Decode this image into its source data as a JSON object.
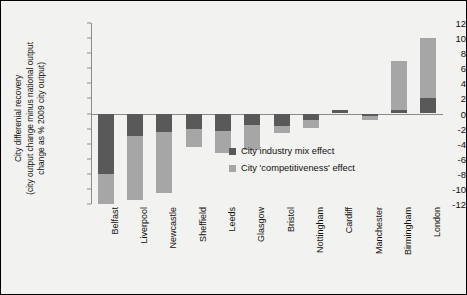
{
  "chart_data": {
    "type": "bar",
    "stacked": true,
    "title": "",
    "xlabel": "",
    "ylabel": "City differenial recovery\n(city output change minus national output\nchange as % 2009 city output)",
    "ylim": [
      -12,
      12
    ],
    "ytick_step": 2,
    "yticks": [
      "12",
      "10",
      "8",
      "6",
      "4",
      "2",
      "0",
      "-2",
      "-4",
      "-6",
      "-8",
      "-10",
      "-12"
    ],
    "grid": false,
    "legend_position": "center",
    "categories": [
      "Belfast",
      "Liverpool",
      "Newcastle",
      "Sheffield",
      "Leeds",
      "Glasgow",
      "Bristol",
      "Nottingham",
      "Cardiff",
      "Manchester",
      "Birmingham",
      "London"
    ],
    "series": [
      {
        "name": "City industry mix effect",
        "color": "#595959",
        "values": [
          -8.0,
          -3.0,
          -2.5,
          -2.0,
          -2.3,
          -1.5,
          -1.6,
          -0.8,
          0.5,
          -0.3,
          0.4,
          2.0
        ]
      },
      {
        "name": "City 'competitiveness' effect",
        "color": "#a6a6a6",
        "values": [
          -4.0,
          -8.5,
          -8.0,
          -2.5,
          -3.0,
          -3.3,
          -1.0,
          -1.1,
          0.0,
          -0.5,
          6.6,
          8.0
        ]
      }
    ],
    "totals": [
      -12.0,
      -11.5,
      -10.5,
      -4.5,
      -5.3,
      -4.8,
      -2.6,
      -1.9,
      0.5,
      -0.8,
      7.0,
      10.0
    ]
  },
  "legend": {
    "items": [
      {
        "label": "City industry mix effect",
        "color": "#595959"
      },
      {
        "label": "City 'competitiveness' effect",
        "color": "#a6a6a6"
      }
    ]
  },
  "colors": {
    "plot_background": "#f2f2f0",
    "frame": "#000000",
    "axis": "#8b8b8b",
    "industry_mix": "#595959",
    "competitiveness": "#a6a6a6",
    "text": "#111111"
  }
}
